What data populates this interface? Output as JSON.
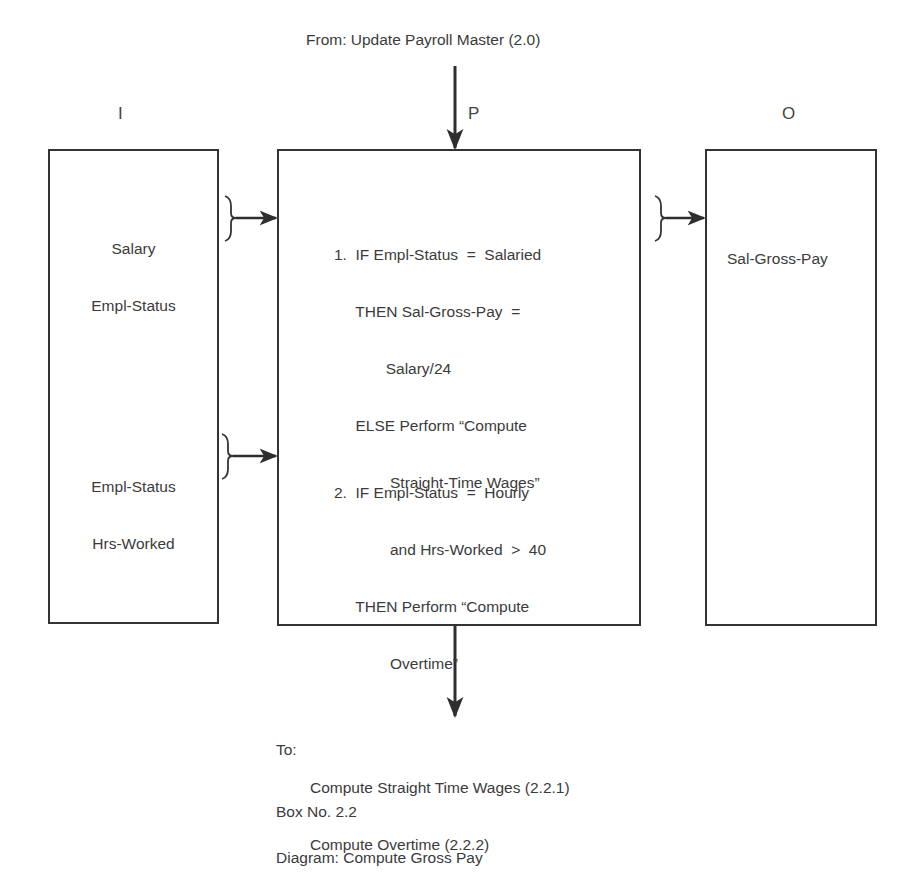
{
  "diagram": {
    "from_label": "From: Update Payroll Master (2.0)",
    "column_headers": {
      "input": "I",
      "process": "P",
      "output": "O"
    },
    "input_box": {
      "groups": [
        {
          "lines": [
            "Salary",
            "Empl-Status"
          ]
        },
        {
          "lines": [
            "Empl-Status",
            "Hrs-Worked"
          ]
        }
      ]
    },
    "process_box": {
      "steps": [
        {
          "lines": [
            "1.  IF Empl-Status  =  Salaried",
            "     THEN Sal-Gross-Pay  =",
            "            Salary/24",
            "     ELSE Perform “Compute",
            "             Straight-Time Wages”"
          ]
        },
        {
          "lines": [
            "2.  IF Empl-Status  =  Hourly",
            "             and Hrs-Worked  >  40",
            "     THEN Perform “Compute",
            "             Overtime”"
          ]
        }
      ]
    },
    "output_box": {
      "groups": [
        {
          "lines": [
            "Sal-Gross-Pay"
          ]
        }
      ]
    },
    "to_block": {
      "prefix": "To:",
      "lines": [
        "Compute Straight Time Wages (2.2.1)",
        "Compute Overtime (2.2.2)"
      ]
    },
    "box_number": "Box No. 2.2",
    "diagram_title": "Diagram: Compute Gross Pay",
    "colors": {
      "line": "#333333",
      "text": "#3b3b3b",
      "background": "#ffffff"
    }
  }
}
